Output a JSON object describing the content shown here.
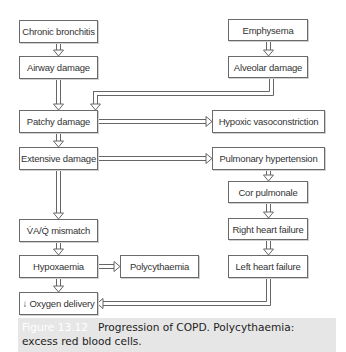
{
  "diagram": {
    "title": "Progression of COPD",
    "nodes": {
      "chronic_bronchitis": "Chronic bronchitis",
      "emphysema": "Emphysema",
      "airway_damage": "Airway damage",
      "alveolar_damage": "Alveolar damage",
      "patchy_damage": "Patchy damage",
      "hypoxic_vasoconstriction": "Hypoxic vasoconstriction",
      "extensive_damage": "Extensive damage",
      "pulmonary_hypertension": "Pulmonary hypertension",
      "cor_pulmonale": "Cor pulmonale",
      "vq_mismatch": "V̇A/Q̇ mismatch",
      "right_heart_failure": "Right heart failure",
      "hypoxaemia": "Hypoxaemia",
      "polycythaemia": "Polycythaemia",
      "left_heart_failure": "Left heart failure",
      "oxygen_delivery": "↓ Oxygen delivery"
    },
    "edges": [
      [
        "chronic_bronchitis",
        "airway_damage"
      ],
      [
        "airway_damage",
        "patchy_damage"
      ],
      [
        "emphysema",
        "alveolar_damage"
      ],
      [
        "alveolar_damage",
        "patchy_damage"
      ],
      [
        "patchy_damage",
        "hypoxic_vasoconstriction"
      ],
      [
        "patchy_damage",
        "extensive_damage"
      ],
      [
        "extensive_damage",
        "pulmonary_hypertension"
      ],
      [
        "extensive_damage",
        "vq_mismatch"
      ],
      [
        "pulmonary_hypertension",
        "cor_pulmonale"
      ],
      [
        "cor_pulmonale",
        "right_heart_failure"
      ],
      [
        "right_heart_failure",
        "left_heart_failure"
      ],
      [
        "vq_mismatch",
        "hypoxaemia"
      ],
      [
        "hypoxaemia",
        "polycythaemia"
      ],
      [
        "hypoxaemia",
        "oxygen_delivery"
      ],
      [
        "left_heart_failure",
        "oxygen_delivery"
      ]
    ]
  },
  "caption": {
    "figure_label": "Figure 13.12",
    "text": "Progression of COPD. Polycythaemia: excess red blood cells."
  }
}
